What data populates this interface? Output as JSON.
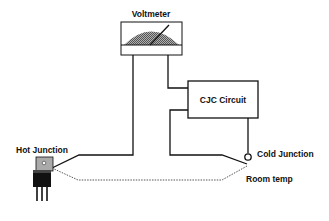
{
  "diagram": {
    "labels": {
      "voltmeter": "Voltmeter",
      "cjc_circuit": "CJC Circuit",
      "hot_junction": "Hot Junction",
      "cold_junction": "Cold Junction",
      "room_temp": "Room temp"
    },
    "components": [
      {
        "id": "voltmeter",
        "type": "analog-meter"
      },
      {
        "id": "cjc_circuit",
        "type": "box"
      },
      {
        "id": "hot_junction",
        "type": "TO-220 package sensor"
      },
      {
        "id": "cold_junction",
        "type": "terminal circle"
      }
    ],
    "wires": [
      {
        "from": "voltmeter",
        "to": "hot_junction",
        "style": "solid"
      },
      {
        "from": "voltmeter",
        "to": "cjc_circuit",
        "style": "solid"
      },
      {
        "from": "cjc_circuit",
        "to": "cold_junction",
        "style": "solid"
      },
      {
        "from": "hot_junction",
        "to": "cold_junction",
        "style": "dotted"
      }
    ],
    "colors": {
      "line": "#111111",
      "meter_scale": "#8a8a8a",
      "background": "#ffffff"
    }
  }
}
